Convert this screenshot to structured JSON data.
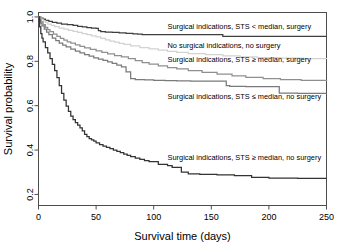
{
  "chart_data": {
    "type": "line",
    "title": "",
    "xlabel": "Survival time (days)",
    "ylabel": "Survival probability",
    "xlim": [
      0,
      250
    ],
    "ylim": [
      0.15,
      1.02
    ],
    "grid": false,
    "legend_position": "inline-annotations",
    "xticks": [
      0,
      50,
      100,
      150,
      200,
      250
    ],
    "xtick_labels": [
      "0",
      "50",
      "100",
      "150",
      "200",
      "250"
    ],
    "yticks": [
      0.2,
      0.4,
      0.6,
      0.8,
      1.0
    ],
    "ytick_labels": [
      "0.2",
      "0.4",
      "0.6",
      "0.8",
      "1.0"
    ],
    "series": [
      {
        "name": "Surgical indications, STS < median, surgery",
        "color": "#3f3f3f",
        "width": 1.25,
        "label_x": 112,
        "label_y": 0.945,
        "x": [
          0,
          2,
          4,
          6,
          9,
          12,
          16,
          20,
          25,
          30,
          34,
          38,
          42,
          46,
          50,
          52,
          54,
          58,
          64,
          70,
          76,
          82,
          86,
          90,
          120,
          155,
          160,
          200,
          250
        ],
        "y": [
          1.0,
          0.995,
          0.99,
          0.985,
          0.98,
          0.975,
          0.972,
          0.968,
          0.965,
          0.962,
          0.958,
          0.955,
          0.952,
          0.95,
          0.948,
          0.938,
          0.934,
          0.932,
          0.93,
          0.928,
          0.926,
          0.924,
          0.922,
          0.92,
          0.92,
          0.92,
          0.912,
          0.912,
          0.912
        ]
      },
      {
        "name": "No surgical indications, no surgery",
        "color": "#d2d2d2",
        "width": 1.25,
        "label_x": 112,
        "label_y": 0.862,
        "x": [
          0,
          2,
          4,
          6,
          8,
          11,
          14,
          18,
          22,
          26,
          30,
          34,
          38,
          42,
          46,
          50,
          54,
          58,
          62,
          66,
          70,
          74,
          80,
          88,
          96,
          104,
          112,
          120,
          130,
          145,
          160,
          175,
          190,
          210,
          230,
          250
        ],
        "y": [
          1.0,
          0.99,
          0.982,
          0.975,
          0.968,
          0.962,
          0.956,
          0.95,
          0.945,
          0.94,
          0.935,
          0.93,
          0.925,
          0.92,
          0.915,
          0.91,
          0.903,
          0.897,
          0.891,
          0.886,
          0.881,
          0.876,
          0.87,
          0.862,
          0.856,
          0.85,
          0.845,
          0.84,
          0.835,
          0.83,
          0.824,
          0.82,
          0.817,
          0.814,
          0.812,
          0.81
        ]
      },
      {
        "name": "Surgical indications, STS ≥ median, surgery",
        "color": "#8f8f8f",
        "width": 1.25,
        "label_x": 112,
        "label_y": 0.795,
        "x": [
          0,
          1,
          2,
          4,
          6,
          8,
          10,
          13,
          16,
          19,
          22,
          25,
          28,
          32,
          36,
          40,
          45,
          50,
          55,
          60,
          66,
          72,
          78,
          84,
          90,
          96,
          104,
          112,
          120,
          130,
          142,
          155,
          168,
          180,
          195,
          210,
          228,
          250
        ],
        "y": [
          1.0,
          0.988,
          0.978,
          0.965,
          0.953,
          0.943,
          0.934,
          0.922,
          0.912,
          0.903,
          0.895,
          0.888,
          0.882,
          0.874,
          0.867,
          0.861,
          0.854,
          0.847,
          0.84,
          0.833,
          0.826,
          0.82,
          0.812,
          0.803,
          0.794,
          0.787,
          0.779,
          0.772,
          0.766,
          0.758,
          0.75,
          0.742,
          0.734,
          0.728,
          0.722,
          0.718,
          0.714,
          0.711
        ]
      },
      {
        "name": "Surgical indications, STS ≤ median, no surgery",
        "color": "#7a7a7a",
        "width": 1.25,
        "label_x": 112,
        "label_y": 0.63,
        "x": [
          0,
          1,
          2,
          3,
          5,
          7,
          9,
          12,
          15,
          18,
          21,
          24,
          28,
          32,
          36,
          40,
          44,
          48,
          52,
          56,
          60,
          64,
          68,
          72,
          76,
          80,
          84,
          92,
          100,
          110,
          120,
          132,
          145,
          158,
          163,
          166,
          180,
          195,
          205,
          209,
          225,
          250
        ],
        "y": [
          1.0,
          0.985,
          0.972,
          0.96,
          0.945,
          0.932,
          0.92,
          0.905,
          0.893,
          0.882,
          0.873,
          0.865,
          0.855,
          0.846,
          0.838,
          0.83,
          0.823,
          0.816,
          0.81,
          0.804,
          0.798,
          0.791,
          0.783,
          0.775,
          0.752,
          0.722,
          0.718,
          0.716,
          0.714,
          0.713,
          0.712,
          0.711,
          0.711,
          0.711,
          0.69,
          0.687,
          0.686,
          0.686,
          0.686,
          0.657,
          0.655,
          0.654
        ]
      },
      {
        "name": "Surgical indications, STS ≥ median, no surgery",
        "color": "#333333",
        "width": 1.25,
        "label_x": 112,
        "label_y": 0.355,
        "x": [
          0,
          1,
          2,
          3,
          4,
          6,
          8,
          10,
          12,
          14,
          16,
          18,
          20,
          22,
          24,
          26,
          28,
          30,
          32,
          34,
          36,
          38,
          40,
          42,
          44,
          46,
          48,
          50,
          53,
          56,
          59,
          62,
          65,
          68,
          71,
          74,
          77,
          80,
          84,
          88,
          92,
          96,
          104,
          112,
          116,
          124,
          130,
          140,
          155,
          170,
          185,
          200,
          225,
          250
        ],
        "y": [
          1.0,
          0.955,
          0.925,
          0.905,
          0.888,
          0.862,
          0.838,
          0.812,
          0.786,
          0.758,
          0.726,
          0.69,
          0.655,
          0.625,
          0.598,
          0.574,
          0.553,
          0.537,
          0.524,
          0.512,
          0.5,
          0.486,
          0.471,
          0.46,
          0.452,
          0.446,
          0.44,
          0.432,
          0.424,
          0.418,
          0.412,
          0.406,
          0.4,
          0.394,
          0.388,
          0.382,
          0.376,
          0.37,
          0.364,
          0.358,
          0.352,
          0.348,
          0.335,
          0.33,
          0.322,
          0.3,
          0.293,
          0.29,
          0.288,
          0.285,
          0.277,
          0.273,
          0.272,
          0.272
        ]
      }
    ]
  },
  "axes": {
    "xlabel": "Survival time (days)",
    "ylabel": "Survival probability"
  }
}
